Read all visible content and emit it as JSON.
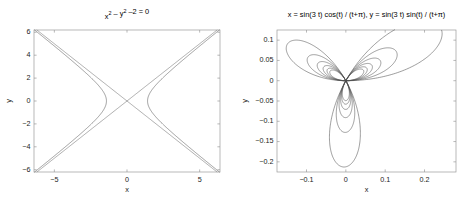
{
  "figure": {
    "background": "#ffffff",
    "width": 473,
    "height": 207
  },
  "chart_data": [
    {
      "id": "left",
      "type": "line",
      "title": "x² – y² –2 = 0",
      "title_parts": [
        {
          "text": "x",
          "sup": "2"
        },
        {
          "text": " – "
        },
        {
          "text": "y",
          "sup": "2"
        },
        {
          "text": " –2 = 0"
        }
      ],
      "xlabel": "x",
      "ylabel": "y",
      "xlim": [
        -6.4,
        6.4
      ],
      "ylim": [
        -6.2,
        6.2
      ],
      "xticks": [
        -5,
        0,
        5
      ],
      "xticklabels": [
        "−5",
        "0",
        "5"
      ],
      "yticks": [
        -6,
        -4,
        -2,
        0,
        2,
        4,
        6
      ],
      "yticklabels": [
        "−6",
        "−4",
        "−2",
        "0",
        "2",
        "4",
        "6"
      ],
      "grid": false,
      "legend": null,
      "equation": "x^2 - y^2 - 2 = 0",
      "curve_color": "#4d4d4d",
      "series": [
        {
          "name": "hyperbola-right-branch",
          "kind": "hyperbola",
          "branch": "right",
          "a": 1.4142
        },
        {
          "name": "hyperbola-left-branch",
          "kind": "hyperbola",
          "branch": "left",
          "a": 1.4142
        },
        {
          "name": "asymptote-positive",
          "kind": "line",
          "slope": 1,
          "intercept": 0
        },
        {
          "name": "asymptote-negative",
          "kind": "line",
          "slope": -1,
          "intercept": 0
        }
      ]
    },
    {
      "id": "right",
      "type": "line",
      "title": "x = sin(3 t)  cos(t) / (t+π), y = sin(3 t)  sin(t) / (t+π)",
      "xlabel": "x",
      "ylabel": "y",
      "xlim": [
        -0.175,
        0.28
      ],
      "ylim": [
        -0.225,
        0.125
      ],
      "xticks": [
        -0.1,
        0,
        0.1,
        0.2
      ],
      "xticklabels": [
        "−0.1",
        "0",
        "0.1",
        "0.2"
      ],
      "yticks": [
        -0.2,
        -0.15,
        -0.1,
        -0.05,
        0,
        0.05,
        0.1
      ],
      "yticklabels": [
        "−0.2",
        "−0.15",
        "−0.1",
        "−0.05",
        "0",
        "0.05",
        "0.1"
      ],
      "grid": false,
      "legend": null,
      "curve_color": "#4d4d4d",
      "parametric": {
        "x_expr": "sin(3 t) * cos(t) / (t + pi)",
        "y_expr": "sin(3 t) * sin(t) / (t + pi)",
        "t_start": 0,
        "t_end": 18.8495559215,
        "t_samples": 3000,
        "petals": 3
      }
    }
  ]
}
